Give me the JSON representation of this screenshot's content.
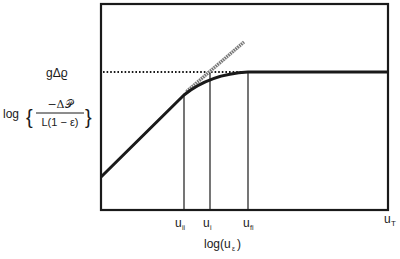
{
  "diagram": {
    "type": "log-log plot schematic",
    "y_axis_label": {
      "prefix": "log",
      "numerator": "−Δ𝒫",
      "denominator": "L(1 − ε)"
    },
    "x_axis_label": "log(u",
    "x_axis_label_sub": "ε",
    "x_axis_label_close": ")",
    "plateau_label": "gΔϱ",
    "x_ticks": [
      {
        "main": "u",
        "sub": "ii"
      },
      {
        "main": "u",
        "sub": "i"
      },
      {
        "main": "u",
        "sub": "fi"
      },
      {
        "main": "u",
        "sub": "T"
      }
    ],
    "elements": [
      "linear rising segment (fixed bed)",
      "curved transition (u_ii to u_fi)",
      "horizontal plateau at gΔϱ (fluidized)",
      "dotted reference line at gΔϱ",
      "hatched extrapolation of linear segment",
      "vertical markers at u_ii, u_i, u_fi"
    ],
    "colors": {
      "line": "#1a1a1a",
      "hatched": "#666666",
      "background": "#ffffff"
    }
  }
}
